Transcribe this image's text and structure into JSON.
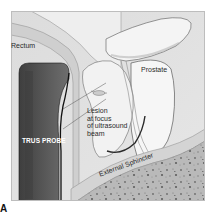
{
  "figure": {
    "panel_letter": "A",
    "labels": {
      "rectum": "Rectum",
      "prostate": "Prostate",
      "lesion_line1": "Lesion",
      "lesion_line2": "at focus",
      "lesion_line3": "of ultrasound",
      "lesion_line4": "beam",
      "probe": "TRUS PROBE",
      "sphincter": "External Sphincter"
    },
    "colors": {
      "background": "#d8d8d8",
      "tissue_light": "#ececec",
      "probe_dark": "#4a4a4a",
      "probe_mid": "#7a7a7a",
      "sphincter_band": "#c8c8c8",
      "muscle_speckle": "#9a9a9a",
      "outline": "#1a1a1a"
    }
  }
}
